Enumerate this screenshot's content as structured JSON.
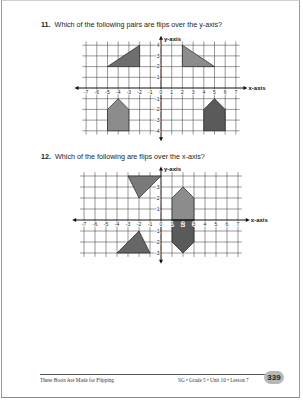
{
  "questions": [
    {
      "number": "11.",
      "text": "Which of the following pairs are flips over the y-axis?"
    },
    {
      "number": "12.",
      "text": "Which of the following are flips over the x-axis?"
    }
  ],
  "footer": {
    "left": "These Boots Are Made for Flipping",
    "right": "SG • Grade 5 • Unit 10 • Lesson 7",
    "page_number": "339"
  },
  "chart_data": [
    {
      "type": "coordinate-grid",
      "title": "Which of the following pairs are flips over the y-axis?",
      "xlabel": "x-axis",
      "ylabel": "y-axis",
      "x_range": [
        -7,
        7
      ],
      "y_range": [
        -4,
        4
      ],
      "x_ticks": [
        -7,
        -6,
        -5,
        -4,
        -3,
        -2,
        -1,
        0,
        1,
        2,
        3,
        4,
        5,
        6,
        7
      ],
      "y_ticks": [
        -4,
        -3,
        -2,
        -1,
        1,
        2,
        3,
        4
      ],
      "grid": true,
      "shapes": [
        {
          "name": "triangle-left",
          "fill": "#6e6e6e",
          "points": [
            [
              -5,
              2
            ],
            [
              -2,
              2
            ],
            [
              -2,
              4
            ]
          ]
        },
        {
          "name": "triangle-right",
          "fill": "#8c8c8c",
          "points": [
            [
              2,
              4
            ],
            [
              2,
              2
            ],
            [
              5,
              2
            ]
          ]
        },
        {
          "name": "pentagon-left",
          "fill": "#8c8c8c",
          "points": [
            [
              -5,
              -4
            ],
            [
              -5,
              -2
            ],
            [
              -4,
              -1
            ],
            [
              -3,
              -2
            ],
            [
              -3,
              -4
            ]
          ]
        },
        {
          "name": "pentagon-right",
          "fill": "#5a5a5a",
          "points": [
            [
              4,
              -4
            ],
            [
              4,
              -2
            ],
            [
              5,
              -1
            ],
            [
              6,
              -2
            ],
            [
              6,
              -4
            ]
          ]
        }
      ]
    },
    {
      "type": "coordinate-grid",
      "title": "Which of the following are flips over the x-axis?",
      "xlabel": "x-axis",
      "ylabel": "y-axis",
      "x_range": [
        -7,
        7
      ],
      "y_range": [
        -3,
        4
      ],
      "x_ticks": [
        -7,
        -6,
        -5,
        -4,
        -3,
        -2,
        -1,
        0,
        1,
        2,
        3,
        4,
        5,
        6,
        7
      ],
      "y_ticks": [
        -3,
        -2,
        -1,
        1,
        2,
        3
      ],
      "grid": true,
      "shapes": [
        {
          "name": "triangle-top",
          "fill": "#7a7a7a",
          "points": [
            [
              -3,
              4
            ],
            [
              0,
              4
            ],
            [
              -2,
              2
            ]
          ]
        },
        {
          "name": "triangle-bottom",
          "fill": "#666666",
          "points": [
            [
              -4,
              -3
            ],
            [
              -1,
              -3
            ],
            [
              -2,
              -1
            ]
          ]
        },
        {
          "name": "hexagon-upper",
          "fill": "#8c8c8c",
          "points": [
            [
              1,
              0
            ],
            [
              1,
              2
            ],
            [
              2,
              3
            ],
            [
              3,
              2
            ],
            [
              3,
              0
            ]
          ]
        },
        {
          "name": "hexagon-lower",
          "fill": "#5a5a5a",
          "points": [
            [
              1,
              0
            ],
            [
              1,
              -2
            ],
            [
              2,
              -3
            ],
            [
              3,
              -2
            ],
            [
              3,
              0
            ]
          ]
        }
      ]
    }
  ]
}
